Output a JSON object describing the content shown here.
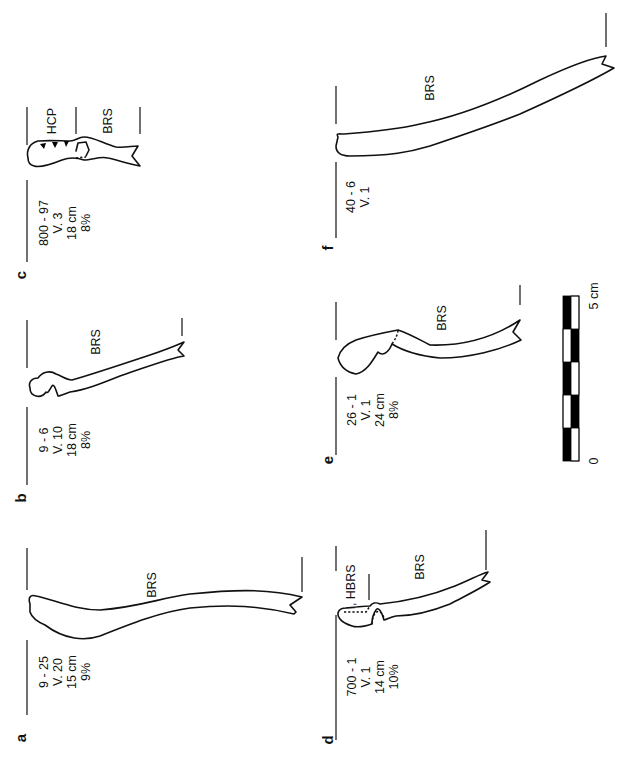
{
  "figure": {
    "orientation": "rotated -90deg (text reads bottom-to-top)",
    "panels": [
      {
        "letter": "a",
        "sherd": "9 - 25",
        "vessel": "V. 20",
        "diameter": "15 cm",
        "percent": "9%",
        "zones": [
          "BRS"
        ]
      },
      {
        "letter": "b",
        "sherd": "9 - 6",
        "vessel": "V. 10",
        "diameter": "18 cm",
        "percent": "8%",
        "zones": [
          "BRS"
        ]
      },
      {
        "letter": "c",
        "sherd": "800 - 97",
        "vessel": "V. 3",
        "diameter": "18 cm",
        "percent": "8%",
        "zones": [
          "HCP",
          "BRS"
        ]
      },
      {
        "letter": "d",
        "sherd": "700 - 1",
        "vessel": "V. 1",
        "diameter": "14 cm",
        "percent": "10%",
        "zones": [
          "I, HBRS",
          "BRS"
        ]
      },
      {
        "letter": "e",
        "sherd": "26 - 1",
        "vessel": "V. 1",
        "diameter": "24 cm",
        "percent": "8%",
        "zones": [
          "BRS"
        ]
      },
      {
        "letter": "f",
        "sherd": "40 - 6",
        "vessel": "V. 1",
        "zones": [
          "BRS"
        ]
      }
    ],
    "scale_bar": {
      "start_label": "0",
      "end_label": "5 cm",
      "segments": 5
    }
  }
}
